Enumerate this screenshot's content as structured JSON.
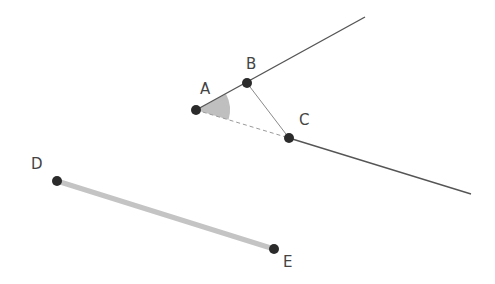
{
  "diagram": {
    "width": 495,
    "height": 284,
    "colors": {
      "line": "#555555",
      "point": "#2b2b2b",
      "dashed": "#9a9a9a",
      "thin": "#8a8a8a",
      "segment_de": "#c4c4c4",
      "angle_fill": "#aaaaaa",
      "label": "#444444"
    },
    "points": {
      "A": {
        "label": "A",
        "x": 196,
        "y": 110,
        "lx": 200,
        "ly": 94
      },
      "B": {
        "label": "B",
        "x": 247,
        "y": 83,
        "lx": 246,
        "ly": 69
      },
      "C": {
        "label": "C",
        "x": 289,
        "y": 138,
        "lx": 299,
        "ly": 125
      },
      "D": {
        "label": "D",
        "x": 57,
        "y": 181,
        "lx": 31,
        "ly": 169
      },
      "E": {
        "label": "E",
        "x": 274,
        "y": 249,
        "lx": 283,
        "ly": 267
      }
    },
    "rays": [
      {
        "name": "ray-AB",
        "from": "A",
        "end": {
          "x": 365,
          "y": 17
        }
      },
      {
        "name": "ray-AC-beyond-C",
        "from": "C",
        "end": {
          "x": 471,
          "y": 194
        }
      }
    ],
    "segments": [
      {
        "name": "segment-BC",
        "from": "B",
        "to": "C",
        "style": "thin"
      },
      {
        "name": "segment-AC",
        "from": "A",
        "to": "C",
        "style": "dashed"
      },
      {
        "name": "segment-DE",
        "from": "D",
        "to": "E",
        "style": "thick-gray"
      }
    ],
    "angle": {
      "name": "angle-BAC",
      "vertex": "A",
      "arm1": "B",
      "arm2": "C",
      "radius": 34
    }
  }
}
